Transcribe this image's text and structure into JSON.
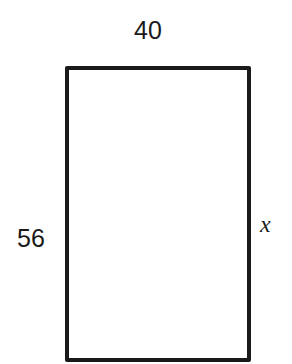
{
  "diagram": {
    "shape": "rectangle",
    "labels": {
      "top": "40",
      "left": "56",
      "right": "x"
    },
    "stroke_color": "#1a1a1a"
  }
}
